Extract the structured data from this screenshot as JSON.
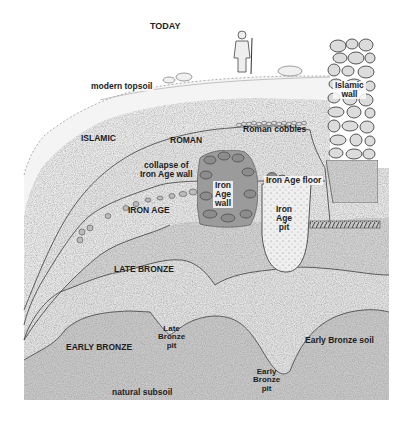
{
  "diagram": {
    "type": "archaeological stratigraphic section",
    "labels": {
      "today": "TODAY",
      "modern_topsoil": "modern topsoil",
      "islamic": "ISLAMIC",
      "islamic_wall_line1": "Islamic",
      "islamic_wall_line2": "wall",
      "roman": "ROMAN",
      "roman_cobbles": "Roman cobbles",
      "collapse_line1": "collapse of",
      "collapse_line2": "Iron Age wall",
      "iron_age": "IRON AGE",
      "iron_age_wall_line1": "Iron",
      "iron_age_wall_line2": "Age",
      "iron_age_wall_line3": "wall",
      "iron_age_floor": "Iron Age floor",
      "iron_age_pit_line1": "Iron",
      "iron_age_pit_line2": "Age",
      "iron_age_pit_line3": "pit",
      "late_bronze": "LATE BRONZE",
      "late_bronze_pit_line1": "Late",
      "late_bronze_pit_line2": "Bronze",
      "late_bronze_pit_line3": "pit",
      "early_bronze": "EARLY BRONZE",
      "early_bronze_soil": "Early Bronze soil",
      "early_bronze_pit_line1": "Early",
      "early_bronze_pit_line2": "Bronze",
      "early_bronze_pit_line3": "pit",
      "natural_subsoil": "natural subsoil"
    },
    "layers_top_to_bottom": [
      "modern topsoil",
      "Islamic",
      "Roman",
      "Iron Age",
      "Late Bronze",
      "Early Bronze",
      "natural subsoil"
    ],
    "features": [
      "person-figure",
      "Islamic wall",
      "Roman cobbles",
      "Iron Age wall",
      "collapse of Iron Age wall",
      "Iron Age floor",
      "Iron Age pit",
      "Late Bronze pit",
      "Early Bronze pit"
    ],
    "colors": {
      "ink": "#3a3a3a",
      "label": "#1e1e1e",
      "topsoil": "#f4f4f4",
      "islamic": "#ececec",
      "roman": "#e6e6e6",
      "iron_age": "#e9e9e9",
      "late_bronze": "#d4d4d4",
      "early_bronze": "#e4e4e4",
      "subsoil": "#c9c9c9",
      "stone": "#dcdcdc",
      "dark_stone": "#8c8c8c"
    }
  }
}
